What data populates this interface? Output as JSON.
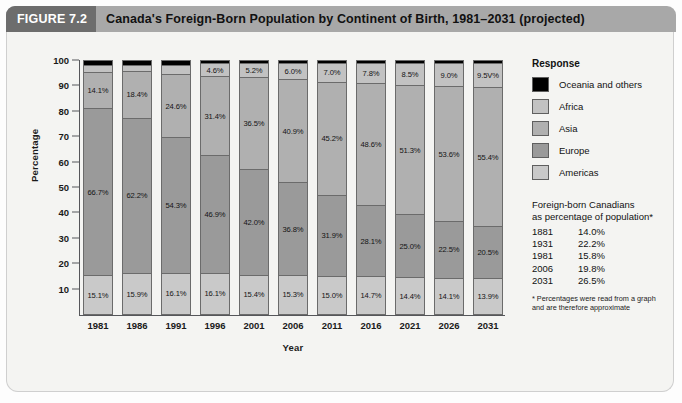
{
  "figure": {
    "tag": "FIGURE 7.2",
    "title": "Canada's Foreign-Born Population by Continent of Birth, 1981–2031 (projected)"
  },
  "legend": {
    "title": "Response",
    "items": [
      {
        "label": "Oceania and others",
        "color": "#000000"
      },
      {
        "label": "Africa",
        "color": "#c2c2c2"
      },
      {
        "label": "Asia",
        "color": "#b0b0b0"
      },
      {
        "label": "Europe",
        "color": "#9a9a9a"
      },
      {
        "label": "Americas",
        "color": "#c9c9c9"
      }
    ]
  },
  "stats": {
    "heading": "Foreign-born Canadians as percentage of population*",
    "heading_line1": "Foreign-born Canadians",
    "heading_line2": "as percentage of population*",
    "rows": [
      {
        "year": "1881",
        "value": "14.0%"
      },
      {
        "year": "1931",
        "value": "22.2%"
      },
      {
        "year": "1981",
        "value": "15.8%"
      },
      {
        "year": "2006",
        "value": "19.8%"
      },
      {
        "year": "2031",
        "value": "26.5%"
      }
    ],
    "footnote": "* Percentages were read from a graph and are therefore approximate"
  },
  "chart_data": {
    "type": "bar",
    "title": "Canada's Foreign-Born Population by Continent of Birth, 1981–2031 (projected)",
    "stacked": true,
    "stack_total": 100,
    "xlabel": "Year",
    "ylabel": "Percentage",
    "ylim": [
      0,
      100
    ],
    "yticks": [
      10,
      20,
      30,
      40,
      50,
      60,
      70,
      80,
      90,
      100
    ],
    "grid": false,
    "legend_position": "right",
    "categories": [
      "1981",
      "1986",
      "1991",
      "1996",
      "2001",
      "2006",
      "2011",
      "2016",
      "2021",
      "2026",
      "2031"
    ],
    "series": [
      {
        "name": "Americas",
        "color": "#c9c9c9",
        "values": [
          15.1,
          15.9,
          16.1,
          16.1,
          15.4,
          15.3,
          15.0,
          14.7,
          14.4,
          14.1,
          13.9
        ],
        "labels": [
          "15.1%",
          "15.9%",
          "16.1%",
          "16.1%",
          "15.4%",
          "15.3%",
          "15.0%",
          "14.7%",
          "14.4%",
          "14.1%",
          "13.9%"
        ]
      },
      {
        "name": "Europe",
        "color": "#9a9a9a",
        "values": [
          66.7,
          62.2,
          54.3,
          46.9,
          42.0,
          36.8,
          31.9,
          28.1,
          25.0,
          22.5,
          20.5
        ],
        "labels": [
          "66.7%",
          "62.2%",
          "54.3%",
          "46.9%",
          "42.0%",
          "36.8%",
          "31.9%",
          "28.1%",
          "25.0%",
          "22.5%",
          "20.5%"
        ]
      },
      {
        "name": "Asia",
        "color": "#b0b0b0",
        "values": [
          14.1,
          18.4,
          24.6,
          31.4,
          36.5,
          40.9,
          45.2,
          48.6,
          51.3,
          53.6,
          55.4
        ],
        "labels": [
          "14.1%",
          "18.4%",
          "24.6%",
          "31.4%",
          "36.5%",
          "40.9%",
          "45.2%",
          "48.6%",
          "51.3%",
          "53.6%",
          "55.4%"
        ]
      },
      {
        "name": "Africa",
        "color": "#c2c2c2",
        "values": [
          2.4,
          2.0,
          3.3,
          4.6,
          5.2,
          6.0,
          7.0,
          7.8,
          8.5,
          9.0,
          9.5
        ],
        "labels": [
          "",
          "",
          "",
          "4.6%",
          "5.2%",
          "6.0%",
          "7.0%",
          "7.8%",
          "8.5%",
          "9.0%",
          "9.5V%"
        ]
      },
      {
        "name": "Oceania and others",
        "color": "#000000",
        "values": [
          1.7,
          1.5,
          1.7,
          1.0,
          0.9,
          1.0,
          0.9,
          0.8,
          0.8,
          0.8,
          0.7
        ],
        "labels": [
          "",
          "",
          "",
          "",
          "",
          "",
          "",
          "",
          "",
          "",
          ""
        ]
      }
    ]
  }
}
